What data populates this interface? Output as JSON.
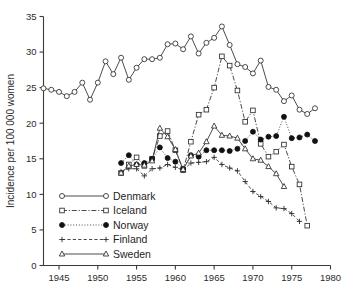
{
  "chart_data": {
    "type": "line",
    "title": "",
    "subtitle": "",
    "xlabel": "",
    "ylabel": "Incidence per 100 000 women",
    "xlim": [
      1943,
      1980
    ],
    "ylim": [
      0,
      35
    ],
    "xticks": [
      1945,
      1950,
      1955,
      1960,
      1965,
      1970,
      1975,
      1980
    ],
    "yticks": [
      0,
      5,
      10,
      15,
      20,
      25,
      30,
      35
    ],
    "grid": false,
    "legend_position": "lower-left-inside",
    "annotations": [],
    "series": [
      {
        "name": "Denmark",
        "marker": "open-circle",
        "line_style": "solid",
        "color": "#2c2c2c",
        "x": [
          1943,
          1944,
          1945,
          1946,
          1947,
          1948,
          1949,
          1950,
          1951,
          1952,
          1953,
          1954,
          1955,
          1956,
          1957,
          1958,
          1959,
          1960,
          1961,
          1962,
          1963,
          1964,
          1965,
          1966,
          1967,
          1968,
          1969,
          1970,
          1971,
          1972,
          1973,
          1974,
          1975,
          1976,
          1977,
          1978
        ],
        "y": [
          24.9,
          24.7,
          24.4,
          23.8,
          24.4,
          25.7,
          23.3,
          25.7,
          28.7,
          26.9,
          29.2,
          26.1,
          27.8,
          29.0,
          29.0,
          29.2,
          31.1,
          31.2,
          30.4,
          32.2,
          29.8,
          31.3,
          32.0,
          33.6,
          31.0,
          28.3,
          27.9,
          27.0,
          28.8,
          25.1,
          24.7,
          23.1,
          23.9,
          21.9,
          21.3,
          22.1
        ]
      },
      {
        "name": "Iceland",
        "marker": "open-square",
        "line_style": "dash-dot",
        "color": "#2c2c2c",
        "x": [
          1953,
          1954,
          1955,
          1956,
          1957,
          1958,
          1959,
          1960,
          1961,
          1962,
          1963,
          1964,
          1965,
          1966,
          1967,
          1968,
          1969,
          1970,
          1971,
          1972,
          1973,
          1974,
          1975,
          1976,
          1977
        ],
        "y": [
          13.0,
          14.2,
          15.2,
          14.0,
          15.0,
          18.2,
          18.9,
          16.2,
          13.4,
          17.4,
          21.2,
          21.9,
          25.0,
          29.4,
          28.1,
          24.6,
          20.2,
          21.8,
          17.1,
          15.3,
          16.0,
          17.0,
          13.9,
          11.4,
          5.6
        ]
      },
      {
        "name": "Norway",
        "marker": "filled-circle",
        "line_style": "dotted",
        "color": "#111111",
        "x": [
          1953,
          1954,
          1955,
          1956,
          1957,
          1958,
          1959,
          1960,
          1961,
          1962,
          1963,
          1964,
          1965,
          1966,
          1967,
          1968,
          1969,
          1970,
          1971,
          1972,
          1973,
          1974,
          1975,
          1976,
          1977,
          1978
        ],
        "y": [
          14.4,
          15.5,
          14.2,
          14.4,
          15.0,
          16.6,
          15.1,
          14.6,
          13.6,
          15.5,
          15.3,
          16.2,
          16.2,
          16.2,
          16.1,
          16.4,
          17.5,
          18.8,
          17.7,
          18.1,
          18.2,
          20.9,
          17.9,
          18.0,
          18.4,
          17.5
        ]
      },
      {
        "name": "Finland",
        "marker": "plus",
        "line_style": "dashed",
        "color": "#2c2c2c",
        "x": [
          1953,
          1954,
          1955,
          1956,
          1957,
          1958,
          1959,
          1960,
          1961,
          1962,
          1963,
          1964,
          1965,
          1966,
          1967,
          1968,
          1969,
          1970,
          1971,
          1972,
          1973,
          1974,
          1975,
          1976
        ],
        "y": [
          13.2,
          13.6,
          13.6,
          12.6,
          13.6,
          13.7,
          14.2,
          13.8,
          13.4,
          14.4,
          14.5,
          14.6,
          15.2,
          14.2,
          13.7,
          13.3,
          11.8,
          10.4,
          9.7,
          9.0,
          8.1,
          8.0,
          7.3,
          6.2
        ]
      },
      {
        "name": "Sweden",
        "marker": "open-triangle",
        "line_style": "solid",
        "color": "#2c2c2c",
        "x": [
          1953,
          1954,
          1955,
          1956,
          1957,
          1958,
          1959,
          1960,
          1961,
          1962,
          1963,
          1964,
          1965,
          1966,
          1967,
          1968,
          1969,
          1970,
          1971,
          1972,
          1973,
          1974
        ],
        "y": [
          13.0,
          14.0,
          14.2,
          14.1,
          14.7,
          19.3,
          18.1,
          16.3,
          13.5,
          15.4,
          15.8,
          17.4,
          19.6,
          18.3,
          18.2,
          17.9,
          16.4,
          15.0,
          14.8,
          13.9,
          12.9,
          11.1
        ]
      }
    ]
  },
  "legend": {
    "items": [
      {
        "label": "Denmark"
      },
      {
        "label": "Iceland"
      },
      {
        "label": "Norway"
      },
      {
        "label": "Finland"
      },
      {
        "label": "Sweden"
      }
    ]
  },
  "axes": {
    "y_title": "Incidence per 100 000 women",
    "x_tick_labels": [
      "1945",
      "1950",
      "1955",
      "1960",
      "1965",
      "1970",
      "1975",
      "1980"
    ],
    "y_tick_labels": [
      "0",
      "5",
      "10",
      "15",
      "20",
      "25",
      "30",
      "35"
    ]
  },
  "colors": {
    "ink": "#2c2c2c",
    "background": "#ffffff"
  }
}
